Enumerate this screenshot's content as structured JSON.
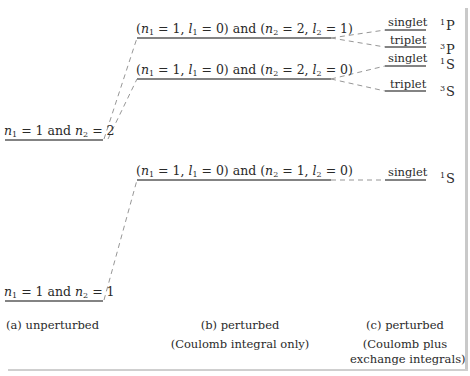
{
  "diagram": {
    "columns": {
      "a": {
        "caption_line1": "(a)  unperturbed",
        "caption_line2": ""
      },
      "b": {
        "caption_line1": "(b)  perturbed",
        "caption_line2": "(Coulomb integral only)"
      },
      "c": {
        "caption_line1": "(c)  perturbed",
        "caption_line2": "(Coulomb plus",
        "caption_line3": "exchange integrals)"
      }
    },
    "unperturbed_levels": [
      {
        "n1": "1",
        "n2": "2",
        "label_and": "and"
      },
      {
        "n1": "1",
        "n2": "1",
        "label_and": "and"
      }
    ],
    "coulomb_levels": [
      {
        "n1": "1",
        "l1": "0",
        "n2": "2",
        "l2": "1",
        "label_and": "and"
      },
      {
        "n1": "1",
        "l1": "0",
        "n2": "2",
        "l2": "0",
        "label_and": "and"
      },
      {
        "n1": "1",
        "l1": "0",
        "n2": "1",
        "l2": "0",
        "label_and": "and"
      }
    ],
    "exchange_levels": [
      {
        "spin": "singlet",
        "term_mult": "1",
        "term_L": "P"
      },
      {
        "spin": "triplet",
        "term_mult": "3",
        "term_L": "P"
      },
      {
        "spin": "singlet",
        "term_mult": "1",
        "term_L": "S"
      },
      {
        "spin": "triplet",
        "term_mult": "3",
        "term_L": "S"
      },
      {
        "spin": "singlet",
        "term_mult": "1",
        "term_L": "S"
      }
    ],
    "colors": {
      "line": "#555555",
      "dash": "#8a8a8a",
      "frame": "#c9c9c9",
      "text": "#2a2a2a"
    }
  }
}
